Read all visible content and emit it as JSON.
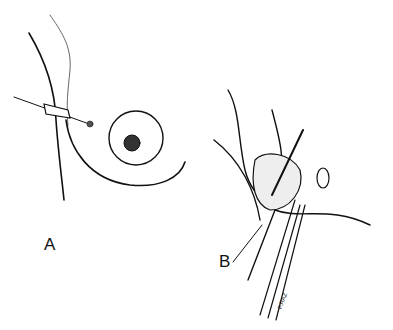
{
  "figure": {
    "panels": [
      {
        "id": "A",
        "label": "A"
      },
      {
        "id": "B",
        "label": "B"
      }
    ],
    "signature": "P.RAZ",
    "colors": {
      "ink": "#111111",
      "background": "#ffffff"
    }
  }
}
